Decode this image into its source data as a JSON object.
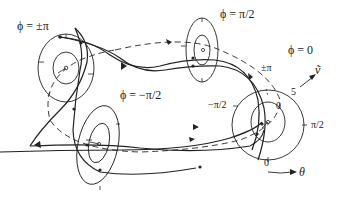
{
  "figure": {
    "type": "phase-space-torus-diagram",
    "phase_labels": {
      "pm_pi": "ϕ = ±π",
      "pi_half": "ϕ = π/2",
      "zero": "ϕ = 0",
      "minus_pi_half": "ϕ = −π/2"
    },
    "theta_ticks": {
      "pm_pi": "±π",
      "minus_pi_half": "−π/2",
      "zero_inner": "0",
      "pi_half": "π/2",
      "zero_bottom": "0"
    },
    "v_tick": "5",
    "axes": {
      "v": "ṽ",
      "theta": "θ"
    },
    "stroke_color": "#222222",
    "background": "#ffffff"
  }
}
